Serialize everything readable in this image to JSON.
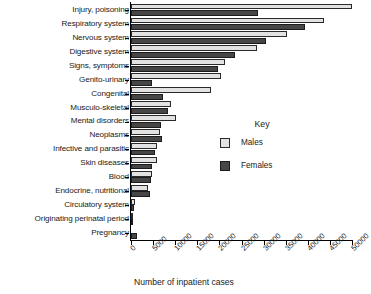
{
  "chart_data": {
    "type": "bar",
    "orientation": "horizontal",
    "title": "",
    "xlabel": "Number of inpatient cases",
    "ylabel": "",
    "xlim": [
      0,
      50000
    ],
    "xticks": [
      0,
      5000,
      10000,
      15000,
      20000,
      25000,
      30000,
      35000,
      40000,
      45000,
      50000
    ],
    "xtick_labels": [
      "0",
      "5000",
      "10000",
      "15000",
      "20000",
      "25000",
      "30000",
      "35000",
      "40000",
      "45000",
      "50000"
    ],
    "grid": false,
    "legend": {
      "title": "Key",
      "position": "center-right",
      "entries": [
        {
          "name": "Males",
          "color": "#e2e2e2"
        },
        {
          "name": "Females",
          "color": "#464646"
        }
      ]
    },
    "categories": [
      "Injury, poisoning",
      "Respiratory system",
      "Nervous system",
      "Digestive system",
      "Signs, symptoms",
      "Genito-urinary",
      "Congenital",
      "Musculo-skeletal",
      "Mental disorders",
      "Neoplasms",
      "Infective and parasitic",
      "Skin diseases",
      "Blood",
      "Endocrine, nutritional",
      "Circulatory system",
      "Originating perinatal period",
      "Pregnancy"
    ],
    "series": [
      {
        "name": "Males",
        "color": "#e2e2e2",
        "values": [
          50000,
          43700,
          35300,
          28500,
          21300,
          20400,
          18100,
          9000,
          10200,
          6600,
          5900,
          5900,
          4800,
          3900,
          900,
          300,
          0
        ]
      },
      {
        "name": "Females",
        "color": "#464646",
        "values": [
          28700,
          39300,
          30500,
          23500,
          19700,
          4800,
          7200,
          8400,
          6800,
          7000,
          5400,
          4800,
          4500,
          4300,
          700,
          200,
          1400
        ]
      }
    ]
  }
}
